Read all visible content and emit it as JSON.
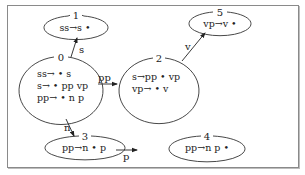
{
  "diagram": {
    "type": "state-machine",
    "nodes": [
      {
        "id": "0",
        "number": "0",
        "items": [
          "ss→ • s",
          "s→ • pp vp",
          "pp→ • n p"
        ]
      },
      {
        "id": "1",
        "number": "1",
        "items": [
          "ss→s •"
        ]
      },
      {
        "id": "2",
        "number": "2",
        "items": [
          "s→pp • vp",
          "vp→ • v"
        ]
      },
      {
        "id": "3",
        "number": "3",
        "items": [
          "pp→n • p"
        ]
      },
      {
        "id": "4",
        "number": "4",
        "items": [
          "pp→n p •"
        ]
      },
      {
        "id": "5",
        "number": "5",
        "items": [
          "vp→v •"
        ]
      }
    ],
    "edges": [
      {
        "from": "0",
        "to": "1",
        "label": "s"
      },
      {
        "from": "0",
        "to": "2",
        "label": "pp"
      },
      {
        "from": "0",
        "to": "3",
        "label": "n"
      },
      {
        "from": "3",
        "to": "4",
        "label": "p"
      },
      {
        "from": "2",
        "to": "5",
        "label": "v"
      }
    ]
  }
}
